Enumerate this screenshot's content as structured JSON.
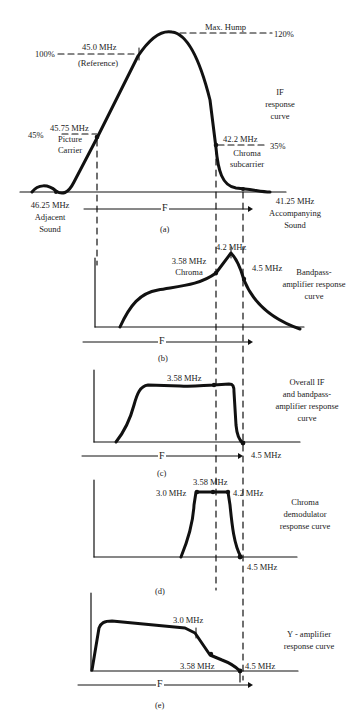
{
  "diagram": {
    "panel_a": {
      "id": "(a)",
      "title": [
        "IF",
        "response",
        "curve"
      ],
      "max_hump": "Max. Hump",
      "pct_120": "120%",
      "pct_100": "100%",
      "ref_freq": "45.0 MHz",
      "ref_note": "(Reference)",
      "pct_45": "45%",
      "picture_freq": "45.75 MHz",
      "picture_label": [
        "Picture",
        "Carrier"
      ],
      "chroma_freq": "42.2 MHz",
      "pct_35": "35%",
      "chroma_label": [
        "Chroma",
        "subcarrier"
      ],
      "adjacent_freq": "46.25 MHz",
      "adjacent_label": [
        "Adjacent",
        "Sound"
      ],
      "accompanying_freq": "41.25 MHz",
      "accompanying_label": [
        "Accompanying",
        "Sound"
      ],
      "axis_label": "F"
    },
    "panel_b": {
      "id": "(b)",
      "title": [
        "Bandpass-",
        "amplifier response",
        "curve"
      ],
      "peak_freq": "4.2 MHz",
      "chroma_freq": "3.58 MHz",
      "chroma_label": "Chroma",
      "upper_freq": "4.5 MHz",
      "axis_label": "F"
    },
    "panel_c": {
      "id": "(c)",
      "title": [
        "Overall IF",
        "and bandpass-",
        "amplifier response",
        "curve"
      ],
      "mid_freq": "3.58 MHz",
      "upper_freq": "4.5 MHz",
      "axis_label": "F"
    },
    "panel_d": {
      "id": "(d)",
      "title": [
        "Chroma",
        "demodulator",
        "response curve"
      ],
      "center_freq": "3.58 MHz",
      "low_freq": "3.0 MHz",
      "high_freq": "4.2 MHz",
      "upper_freq": "4.5 MHz"
    },
    "panel_e": {
      "id": "(e)",
      "title": [
        "Y - amplifier",
        "response curve"
      ],
      "knee_freq": "3.0 MHz",
      "chroma_freq": "3.58 MHz",
      "upper_freq": "4.5 MHz",
      "axis_label": "F"
    }
  }
}
